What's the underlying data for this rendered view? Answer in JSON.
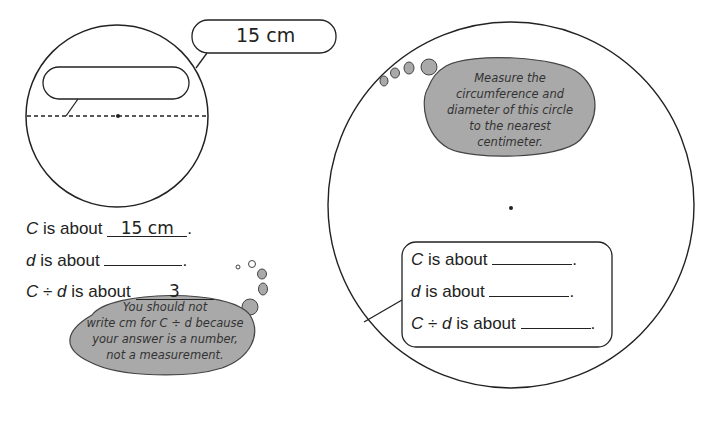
{
  "left_example": {
    "circumference_label": "15 cm",
    "diameter_label": "",
    "lines": {
      "c_prefix_var": "C",
      "c_prefix": " is about ",
      "c_value": "15 cm",
      "d_prefix_var": "d",
      "d_prefix": " is about ",
      "d_value": "",
      "ratio_var1": "C",
      "ratio_op": " ÷ ",
      "ratio_var2": "d",
      "ratio_prefix": " is about ",
      "ratio_value": "3"
    },
    "thought_bubble": {
      "line1": "You should not",
      "line2": "write cm for C ÷ d because",
      "line3": "your answer is a number,",
      "line4": "not a measurement."
    }
  },
  "right_exercise": {
    "thought_bubble": {
      "line1": "Measure the",
      "line2": "circumference and",
      "line3": "diameter of this circle",
      "line4": "to the nearest",
      "line5": "centimeter."
    },
    "lines": {
      "c_var": "C",
      "c_text": " is about ",
      "c_value": "",
      "d_var": "d",
      "d_text": " is about ",
      "d_value": "",
      "r_var1": "C",
      "r_op": " ÷ ",
      "r_var2": "d",
      "r_text": " is about ",
      "r_value": ""
    }
  },
  "colors": {
    "bubble_fill": "#a9a9a9",
    "ink": "#222222"
  }
}
